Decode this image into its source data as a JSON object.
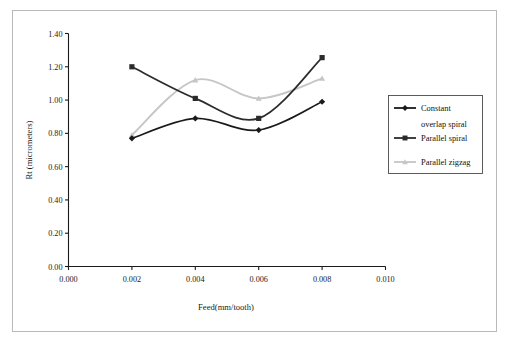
{
  "chart_data": {
    "type": "line",
    "title": "",
    "xlabel": "Feed(mm/tooth)",
    "ylabel": "Rt (micrometers)",
    "x": [
      0.002,
      0.004,
      0.006,
      0.008
    ],
    "xlim": [
      0.0,
      0.01
    ],
    "ylim": [
      0.0,
      1.4
    ],
    "xticks": [
      "0.000",
      "0.002",
      "0.004",
      "0.006",
      "0.008",
      "0.010"
    ],
    "xtick_values": [
      0.0,
      0.002,
      0.004,
      0.006,
      0.008,
      0.01
    ],
    "yticks": [
      "0.00",
      "0.20",
      "0.40",
      "0.60",
      "0.80",
      "1.00",
      "1.20",
      "1.40"
    ],
    "ytick_values": [
      0.0,
      0.2,
      0.4,
      0.6,
      0.8,
      1.0,
      1.2,
      1.4
    ],
    "grid": false,
    "legend_position": "right",
    "series": [
      {
        "name": "Constant overlap spiral",
        "legend_label_line1": "Constant",
        "legend_label_line2": "overlap spiral",
        "marker": "diamond",
        "color": "#1a1a1a",
        "values": [
          0.77,
          0.89,
          0.82,
          0.99
        ]
      },
      {
        "name": "Parallel spiral",
        "legend_label_line1": "Parallel spiral",
        "legend_label_line2": "",
        "marker": "square",
        "color": "#2b2b2b",
        "values": [
          1.2,
          1.01,
          0.89,
          1.255
        ]
      },
      {
        "name": "Parallel zigzag",
        "legend_label_line1": "Parallel zigzag",
        "legend_label_line2": "",
        "marker": "triangle",
        "color": "#c6c6c6",
        "values": [
          0.79,
          1.12,
          1.01,
          1.13
        ]
      }
    ]
  },
  "axes": {
    "x_title": "Feed(mm/tooth)",
    "y_title": "Rt (micrometers)"
  },
  "legend": {
    "entries": [
      {
        "line1": "Constant",
        "line2": "overlap spiral"
      },
      {
        "line1": "Parallel spiral",
        "line2": ""
      },
      {
        "line1": "Parallel zigzag",
        "line2": ""
      }
    ]
  },
  "colors": {
    "series1": "#1a1a1a",
    "series2": "#2b2b2b",
    "series3": "#c6c6c6",
    "axis": "#1a1a1a",
    "frame": "#b9b9b9"
  }
}
